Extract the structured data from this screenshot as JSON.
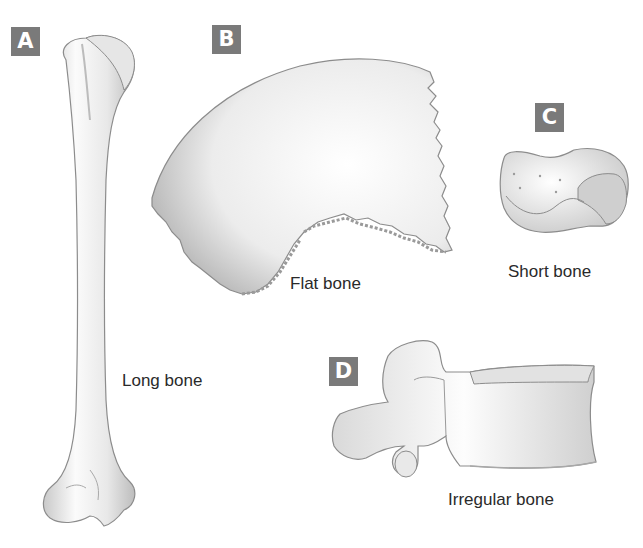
{
  "figure": {
    "panels": [
      {
        "id": "A",
        "label": "A",
        "caption": "Long bone",
        "depicts": "humerus"
      },
      {
        "id": "B",
        "label": "B",
        "caption": "Flat bone",
        "depicts": "parietal bone"
      },
      {
        "id": "C",
        "label": "C",
        "caption": "Short bone",
        "depicts": "carpal bone"
      },
      {
        "id": "D",
        "label": "D",
        "caption": "Irregular bone",
        "depicts": "vertebra"
      }
    ],
    "colors": {
      "badge": "#7a7a7a",
      "badge_text": "#ffffff",
      "bone_fill": "#f2f2f2",
      "bone_shade": "#b8b8b8",
      "outline": "#8c8c8c",
      "caption_text": "#2a2a2a"
    }
  }
}
